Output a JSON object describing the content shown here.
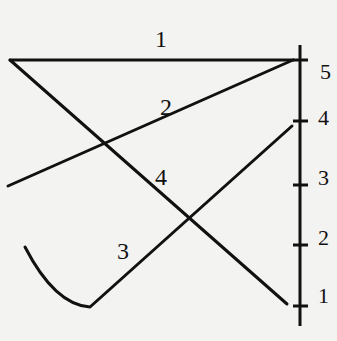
{
  "diagram": {
    "background": "#f3f3f1",
    "stroke_color": "#111111",
    "axis": {
      "x": 300,
      "y_top": 45,
      "y_bottom": 326,
      "ticks": [
        {
          "label": "5",
          "y": 60
        },
        {
          "label": "4",
          "y": 121
        },
        {
          "label": "3",
          "y": 185
        },
        {
          "label": "2",
          "y": 245
        },
        {
          "label": "1",
          "y": 306
        }
      ]
    },
    "lines": [
      {
        "label": "1",
        "label_pos": [
          162,
          50
        ],
        "path": "M10,60 L293,60"
      },
      {
        "label": "2",
        "label_pos": [
          168,
          117
        ],
        "path": "M8,186 L293,60"
      },
      {
        "label": "3",
        "label_pos": [
          124,
          261
        ],
        "path": "M25,247 Q55,305 90,307 L292,126"
      },
      {
        "label": "4",
        "label_pos": [
          162,
          186
        ],
        "path": "M10,60 L287,304"
      }
    ]
  }
}
